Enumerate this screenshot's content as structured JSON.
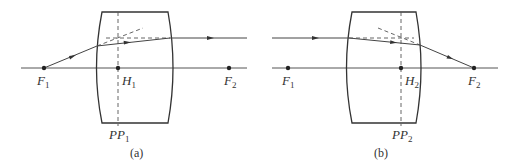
{
  "figure": {
    "colors": {
      "line": "#3a3a3a",
      "background": "#ffffff"
    },
    "panels": [
      {
        "id": "a",
        "caption": "(a)",
        "labels": {
          "F1": {
            "base": "F",
            "sub": "1"
          },
          "H": {
            "base": "H",
            "sub": "1"
          },
          "F2": {
            "base": "F",
            "sub": "2"
          },
          "PP": {
            "base": "PP",
            "sub": "1"
          }
        }
      },
      {
        "id": "b",
        "caption": "(b)",
        "labels": {
          "F1": {
            "base": "F",
            "sub": "1"
          },
          "H": {
            "base": "H",
            "sub": "2"
          },
          "F2": {
            "base": "F",
            "sub": "2"
          },
          "PP": {
            "base": "PP",
            "sub": "2"
          }
        }
      }
    ]
  }
}
